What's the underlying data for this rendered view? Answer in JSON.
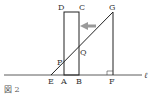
{
  "figure": {
    "caption": "図 2",
    "line_label": "ℓ",
    "points": {
      "A": "A",
      "B": "B",
      "C": "C",
      "D": "D",
      "E": "E",
      "F": "F",
      "G": "G",
      "P": "P",
      "Q": "Q"
    },
    "arrow_direction": "left",
    "colors": {
      "stroke": "#222222",
      "arrow": "#999999"
    }
  }
}
